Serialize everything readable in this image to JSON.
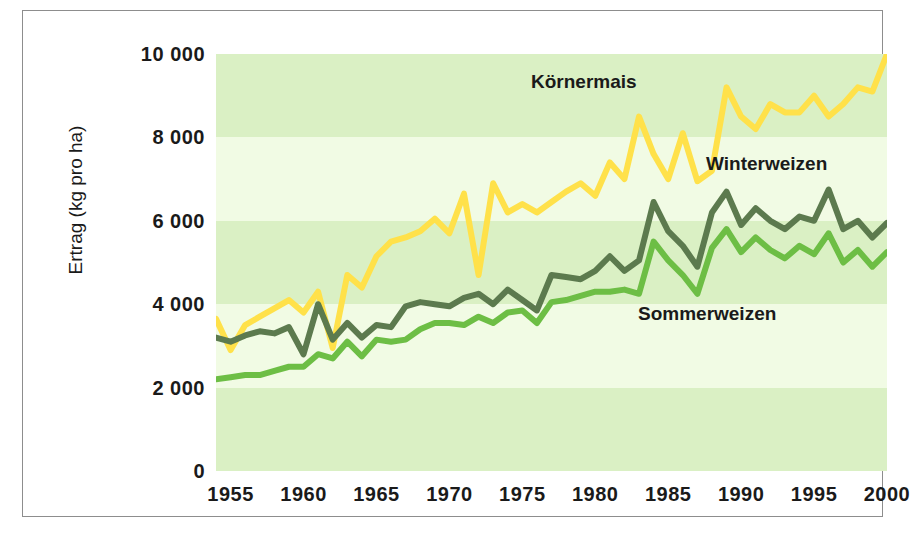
{
  "chart_data": {
    "type": "line",
    "title": "",
    "xlabel": "",
    "ylabel": "Ertrag (kg pro ha)",
    "xlim": [
      1954,
      2000
    ],
    "ylim": [
      0,
      10000
    ],
    "grid": false,
    "background_bands": true,
    "legend_position": "in-plot-annotations",
    "ytick_labels": [
      "10 000",
      "8 000",
      "6 000",
      "4 000",
      "2 000",
      "0"
    ],
    "ytick_values": [
      10000,
      8000,
      6000,
      4000,
      2000,
      0
    ],
    "xtick_labels": [
      "1955",
      "1960",
      "1965",
      "1970",
      "1975",
      "1980",
      "1985",
      "1990",
      "1995",
      "2000"
    ],
    "xtick_values": [
      1955,
      1960,
      1965,
      1970,
      1975,
      1980,
      1985,
      1990,
      1995,
      2000
    ],
    "x": [
      1954,
      1955,
      1956,
      1957,
      1958,
      1959,
      1960,
      1961,
      1962,
      1963,
      1964,
      1965,
      1966,
      1967,
      1968,
      1969,
      1970,
      1971,
      1972,
      1973,
      1974,
      1975,
      1976,
      1977,
      1978,
      1979,
      1980,
      1981,
      1982,
      1983,
      1984,
      1985,
      1986,
      1987,
      1988,
      1989,
      1990,
      1991,
      1992,
      1993,
      1994,
      1995,
      1996,
      1997,
      1998,
      1999,
      2000
    ],
    "series": [
      {
        "name": "Körnermais",
        "color": "#FFE14A",
        "values": [
          3650,
          2900,
          3500,
          3700,
          3900,
          4100,
          3800,
          4300,
          2950,
          4700,
          4400,
          5150,
          5500,
          5600,
          5750,
          6050,
          5700,
          6650,
          4700,
          6900,
          6200,
          6400,
          6200,
          6450,
          6700,
          6900,
          6600,
          7400,
          7000,
          8500,
          7600,
          7000,
          8100,
          6950,
          7200,
          9200,
          8500,
          8200,
          8800,
          8600,
          8600,
          9000,
          8500,
          8800,
          9200,
          9100,
          10000
        ]
      },
      {
        "name": "Winterweizen",
        "color": "#5C7A4E",
        "values": [
          3200,
          3100,
          3250,
          3350,
          3300,
          3450,
          2800,
          4000,
          3150,
          3550,
          3200,
          3500,
          3450,
          3950,
          4050,
          4000,
          3950,
          4150,
          4250,
          4000,
          4350,
          4100,
          3850,
          4700,
          4650,
          4600,
          4800,
          5150,
          4800,
          5050,
          6450,
          5750,
          5400,
          4900,
          6200,
          6700,
          5900,
          6300,
          6000,
          5800,
          6100,
          6000,
          6750,
          5800,
          6000,
          5600,
          5950
        ]
      },
      {
        "name": "Sommerweizen",
        "color": "#6DBE45",
        "values": [
          2200,
          2250,
          2300,
          2300,
          2400,
          2500,
          2500,
          2800,
          2700,
          3100,
          2750,
          3150,
          3100,
          3150,
          3400,
          3550,
          3550,
          3500,
          3700,
          3550,
          3800,
          3850,
          3550,
          4050,
          4100,
          4200,
          4300,
          4300,
          4350,
          4250,
          5500,
          5050,
          4700,
          4250,
          5350,
          5800,
          5250,
          5600,
          5300,
          5100,
          5400,
          5200,
          5700,
          5000,
          5300,
          4900,
          5250
        ]
      }
    ],
    "annotations": [
      {
        "text": "Körnermais",
        "x_px": 530,
        "y_px": 70
      },
      {
        "text": "Winterweizen",
        "x_px": 705,
        "y_px": 152
      },
      {
        "text": "Sommerweizen",
        "x_px": 637,
        "y_px": 302
      }
    ],
    "bands": [
      {
        "from": 0,
        "to": 2000,
        "color": "#DAF0C4"
      },
      {
        "from": 2000,
        "to": 4000,
        "color": "#F1FBE4"
      },
      {
        "from": 4000,
        "to": 6000,
        "color": "#DAF0C4"
      },
      {
        "from": 6000,
        "to": 8000,
        "color": "#F1FBE4"
      },
      {
        "from": 8000,
        "to": 10000,
        "color": "#DAF0C4"
      }
    ]
  }
}
